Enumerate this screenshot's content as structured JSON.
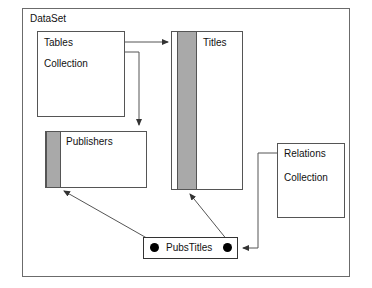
{
  "diagram": {
    "title": "DataSet",
    "frame": {
      "label": "DataSet"
    },
    "nodes": [
      {
        "id": "tables-collection",
        "name": "tables-collection-box",
        "line1": "Tables",
        "line2": "Collection",
        "has_stripe": false
      },
      {
        "id": "titles",
        "name": "titles-box",
        "line1": "Titles",
        "line2": "",
        "has_stripe": true,
        "stripe_color": "#a9a9a9"
      },
      {
        "id": "publishers",
        "name": "publishers-box",
        "line1": "Publishers",
        "line2": "",
        "has_stripe": true,
        "stripe_color": "#a9a9a9"
      },
      {
        "id": "relations-collection",
        "name": "relations-collection-box",
        "line1": "Relations",
        "line2": "Collection",
        "has_stripe": false
      }
    ],
    "relation_node": {
      "label": "PubsTitles",
      "endpoint_left": "relation-endpoint-dot-left",
      "endpoint_right": "relation-endpoint-dot-right"
    },
    "connectors": [
      {
        "id": "tables-to-titles",
        "from": "Tables Collection",
        "to": "Titles",
        "style": "orthogonal-arrow"
      },
      {
        "id": "tables-to-publishers",
        "from": "Tables Collection",
        "to": "Publishers",
        "style": "orthogonal-arrow"
      },
      {
        "id": "pubstitles-to-publishers",
        "from": "PubsTitles",
        "to": "Publishers",
        "style": "diagonal-arrow"
      },
      {
        "id": "pubstitles-to-titles",
        "from": "PubsTitles",
        "to": "Titles",
        "style": "diagonal-arrow"
      },
      {
        "id": "relations-to-pubstitles",
        "from": "Relations Collection",
        "to": "PubsTitles",
        "style": "orthogonal-arrow"
      }
    ],
    "colors": {
      "stripe": "#a9a9a9",
      "border": "#555555",
      "line": "#555555",
      "text": "#111111",
      "background": "#ffffff"
    }
  }
}
